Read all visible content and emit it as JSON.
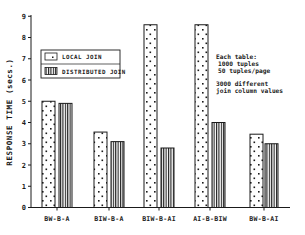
{
  "chart_data": {
    "type": "bar",
    "title": "",
    "xlabel": "",
    "ylabel": "RESPONSE TIME (secs.)",
    "ylim": [
      0,
      9
    ],
    "yticks": [
      0,
      1,
      2,
      3,
      4,
      5,
      6,
      7,
      8,
      9
    ],
    "grid": false,
    "legend_position": "upper-left",
    "categories": [
      "BW-B-A",
      "BIW-B-A",
      "BIW-B-AI",
      "AI-B-BIW",
      "BW-B-AI"
    ],
    "series": [
      {
        "name": "LOCAL JOIN",
        "pattern": "dots",
        "values": [
          5.0,
          3.55,
          8.6,
          8.6,
          3.45
        ]
      },
      {
        "name": "DISTRIBUTED JOIN",
        "pattern": "vertical-stripes",
        "values": [
          4.9,
          3.1,
          2.8,
          4.0,
          3.0
        ]
      }
    ],
    "annotations": [
      "Each table:",
      "1000 tuples",
      "50 tuples/page",
      "3000 different",
      "join column values"
    ]
  },
  "axis": {
    "y_title": "RESPONSE TIME (secs.)",
    "y_ticks": [
      "0",
      "1",
      "2",
      "3",
      "4",
      "5",
      "6",
      "7",
      "8",
      "9"
    ]
  },
  "categories": [
    "BW-B-A",
    "BIW-B-A",
    "BIW-B-AI",
    "AI-B-BIW",
    "BW-B-AI"
  ],
  "legend": {
    "local": "LOCAL JOIN",
    "distributed": "DISTRIBUTED JOIN"
  },
  "note": {
    "line1": "Each table:",
    "line2": "1000 tuples",
    "line3": "50 tuples/page",
    "line4": "3000 different",
    "line5": "join column values"
  },
  "colors": {
    "ink": "#1a1a1a",
    "background": "#ffffff"
  }
}
